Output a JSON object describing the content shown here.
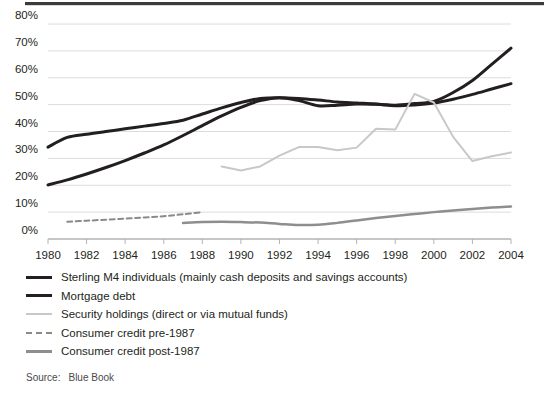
{
  "chart_data": {
    "type": "line",
    "title": "",
    "xlabel": "",
    "ylabel": "",
    "xlim": [
      1980,
      2004
    ],
    "ylim": [
      0,
      80
    ],
    "grid": true,
    "legend_position": "below",
    "x_tick_labels": [
      "1980",
      "1982",
      "1984",
      "1986",
      "1988",
      "1990",
      "1992",
      "1994",
      "1996",
      "1998",
      "2000",
      "2002",
      "2004"
    ],
    "y_tick_labels": [
      "0%",
      "10%",
      "20%",
      "30%",
      "40%",
      "50%",
      "60%",
      "70%",
      "80%"
    ],
    "y_tick_values": [
      0,
      10,
      20,
      30,
      40,
      50,
      60,
      70,
      80
    ],
    "series": [
      {
        "name": "Sterling M4 individuals (mainly cash deposits and savings accounts)",
        "color": "#231f20",
        "style": "solid",
        "width": 3,
        "x": [
          1980,
          1981,
          1982,
          1983,
          1984,
          1985,
          1986,
          1987,
          1988,
          1989,
          1990,
          1991,
          1992,
          1993,
          1994,
          1995,
          1996,
          1997,
          1998,
          1999,
          2000,
          2001,
          2002,
          2003,
          2004
        ],
        "values": [
          34.2,
          37.8,
          39.0,
          40.0,
          41.0,
          42.0,
          43.0,
          44.2,
          46.5,
          48.8,
          50.8,
          52.3,
          52.6,
          52.3,
          51.7,
          51.0,
          50.6,
          50.2,
          49.6,
          49.9,
          50.6,
          52.0,
          53.8,
          55.8,
          57.8
        ]
      },
      {
        "name": "Mortgage debt",
        "color": "#231f20",
        "style": "solid",
        "width": 3,
        "x": [
          1980,
          1981,
          1982,
          1983,
          1984,
          1985,
          1986,
          1987,
          1988,
          1989,
          1990,
          1991,
          1992,
          1993,
          1994,
          1995,
          1996,
          1997,
          1998,
          1999,
          2000,
          2001,
          2002,
          2003,
          2004
        ],
        "values": [
          20.1,
          22.0,
          24.2,
          26.6,
          29.2,
          32.0,
          35.0,
          38.5,
          42.2,
          45.8,
          49.0,
          51.5,
          52.6,
          51.5,
          49.6,
          49.8,
          50.2,
          50.1,
          49.8,
          50.4,
          51.2,
          54.5,
          59.0,
          65.0,
          71.0
        ]
      },
      {
        "name": "Security holdings (direct or via mutual funds)",
        "color": "#c8c8c8",
        "style": "solid",
        "width": 2,
        "x": [
          1989,
          1990,
          1991,
          1992,
          1993,
          1994,
          1995,
          1996,
          1997,
          1998,
          1999,
          2000,
          2001,
          2002,
          2003,
          2004
        ],
        "values": [
          27.0,
          25.5,
          27.0,
          31.0,
          34.2,
          34.2,
          33.0,
          34.0,
          41.0,
          40.7,
          54.0,
          50.8,
          38.0,
          29.0,
          30.8,
          32.2
        ]
      },
      {
        "name": "Consumer credit pre-1987",
        "color": "#8a8a8a",
        "style": "dashed",
        "width": 2,
        "x": [
          1981,
          1982,
          1983,
          1984,
          1985,
          1986,
          1987,
          1988
        ],
        "values": [
          6.4,
          6.8,
          7.2,
          7.6,
          8.0,
          8.5,
          9.2,
          10.0
        ]
      },
      {
        "name": "Consumer credit post-1987",
        "color": "#8e8e8e",
        "style": "solid",
        "width": 2.5,
        "x": [
          1987,
          1988,
          1989,
          1990,
          1991,
          1992,
          1993,
          1994,
          1995,
          1996,
          1997,
          1998,
          1999,
          2000,
          2001,
          2002,
          2003,
          2004
        ],
        "values": [
          6.0,
          6.3,
          6.4,
          6.3,
          6.1,
          5.6,
          5.2,
          5.3,
          6.0,
          6.9,
          7.8,
          8.6,
          9.3,
          10.0,
          10.6,
          11.2,
          11.7,
          12.1
        ]
      }
    ]
  },
  "legend": {
    "items": [
      {
        "label": "Sterling M4 individuals (mainly cash deposits and savings accounts)",
        "swatch": "thick-black"
      },
      {
        "label": "Mortgage debt",
        "swatch": "thick-black"
      },
      {
        "label": "Security holdings (direct or via mutual funds)",
        "swatch": "light-gray"
      },
      {
        "label": "Consumer credit pre-1987",
        "swatch": "dashed-gray"
      },
      {
        "label": "Consumer credit post-1987",
        "swatch": "mid-gray"
      }
    ]
  },
  "footer": {
    "source_label": "Source:",
    "source_value": "Blue Book"
  },
  "colors": {
    "ink": "#231f20",
    "gridline": "#dcdcdc",
    "axis": "#b4b4b4",
    "light_gray_series": "#c8c8c8",
    "mid_gray_series": "#8e8e8e",
    "top_rule": "#3a3a3a"
  }
}
